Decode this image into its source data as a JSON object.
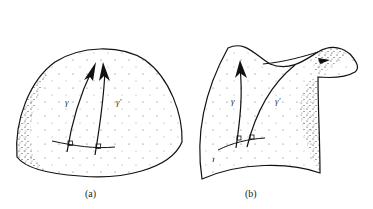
{
  "panels": [
    {
      "id": "a",
      "caption": "(a)",
      "surface": "dome",
      "curves": [
        {
          "label": "γ"
        },
        {
          "label": "γ′"
        }
      ]
    },
    {
      "id": "b",
      "caption": "(b)",
      "surface": "saddle",
      "curves": [
        {
          "label": "γ"
        },
        {
          "label": "γ′"
        }
      ]
    }
  ],
  "colors": {
    "ink": "#111111",
    "background": "#ffffff"
  }
}
